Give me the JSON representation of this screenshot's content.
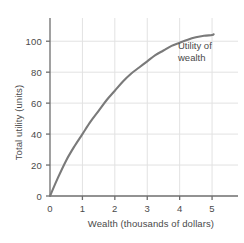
{
  "chart_data": {
    "type": "line",
    "title": "",
    "xlabel": "Wealth (thousands of dollars)",
    "ylabel": "Total utility (units)",
    "xlim": [
      0,
      5.8
    ],
    "ylim": [
      0,
      115
    ],
    "grid": true,
    "legend_position": "inline-annotation",
    "annotations": [
      {
        "name": "utility-of-wealth",
        "line1": "Utility of",
        "line2": "wealth",
        "x": 5.0,
        "y": 96
      }
    ],
    "xticks": [
      0,
      1,
      2,
      3,
      4,
      5
    ],
    "xtick_labels": [
      "0",
      "1",
      "2",
      "3",
      "4",
      "5"
    ],
    "yticks": [
      0,
      20,
      40,
      60,
      80,
      100
    ],
    "ytick_labels": [
      "0",
      "20",
      "40",
      "60",
      "80",
      "100"
    ],
    "series": [
      {
        "name": "Utility of wealth",
        "color": "#7a7a7a",
        "x": [
          0.0,
          0.25,
          0.5,
          0.75,
          1.0,
          1.25,
          1.5,
          1.75,
          2.0,
          2.25,
          2.5,
          2.75,
          3.0,
          3.25,
          3.5,
          3.75,
          4.0,
          4.25,
          4.5,
          4.75,
          5.0,
          5.05
        ],
        "values": [
          0,
          12,
          23,
          32,
          40,
          48,
          55,
          62,
          68,
          74,
          79,
          83,
          87,
          91,
          94,
          97,
          99,
          101,
          102.5,
          103.5,
          104,
          104.5
        ]
      }
    ]
  },
  "colors": {
    "curve": "#7a7a7a",
    "axis": "#6e6e6e",
    "grid": "#e2e2e2",
    "text": "#4a4a4a",
    "background": "#ffffff"
  }
}
